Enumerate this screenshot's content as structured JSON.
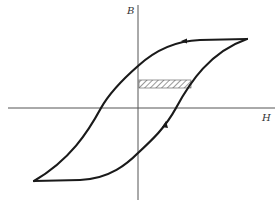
{
  "diagram": {
    "type": "hysteresis-loop",
    "axes": {
      "vertical_label": "B",
      "horizontal_label": "H"
    },
    "loop": {
      "upper_branch_direction": "left",
      "lower_branch_direction": "up",
      "stroke_color": "#1a1a1a"
    },
    "shaded_region": {
      "pattern": "diagonal-hatch",
      "color": "#555555"
    }
  }
}
